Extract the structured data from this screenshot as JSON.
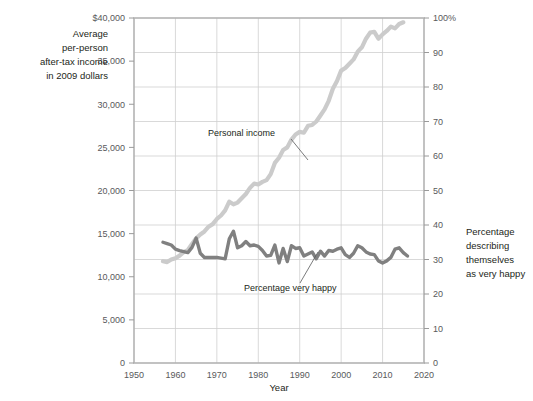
{
  "chart_data": {
    "type": "line",
    "title": "",
    "xlabel": "Year",
    "xlim": [
      1950,
      2020
    ],
    "xticks": [
      1950,
      1960,
      1970,
      1980,
      1990,
      2000,
      2010,
      2020
    ],
    "grid": true,
    "legend_position": "inline-annotations",
    "left_axis": {
      "label": "Average per-person after-tax income in 2009 dollars",
      "label_lines": [
        "Average",
        "per-person",
        "after-tax income",
        "in 2009 dollars"
      ],
      "ticks": [
        0,
        5000,
        10000,
        15000,
        20000,
        25000,
        30000,
        35000,
        40000
      ],
      "tick_labels": [
        "0",
        "5,000",
        "10,000",
        "15,000",
        "20,000",
        "25,000",
        "30,000",
        "35,000",
        "$40,000"
      ],
      "lim": [
        0,
        40000
      ]
    },
    "right_axis": {
      "label": "Percentage describing themselves as very happy",
      "label_lines": [
        "Percentage",
        "describing",
        "themselves",
        "as very happy"
      ],
      "ticks": [
        0,
        10,
        20,
        30,
        40,
        50,
        60,
        70,
        80,
        90,
        100
      ],
      "tick_labels": [
        "0",
        "10",
        "20",
        "30",
        "40",
        "50",
        "60",
        "70",
        "80",
        "90",
        "100%"
      ],
      "lim": [
        0,
        100
      ]
    },
    "series": [
      {
        "name": "Personal income",
        "axis": "left",
        "color": "#cbcbcb",
        "annotation": "Personal income",
        "x": [
          1957,
          1958,
          1959,
          1960,
          1961,
          1962,
          1963,
          1964,
          1965,
          1966,
          1967,
          1968,
          1969,
          1970,
          1971,
          1972,
          1973,
          1974,
          1975,
          1976,
          1977,
          1978,
          1979,
          1980,
          1981,
          1982,
          1983,
          1984,
          1985,
          1986,
          1987,
          1988,
          1989,
          1990,
          1991,
          1992,
          1993,
          1994,
          1995,
          1996,
          1997,
          1998,
          1999,
          2000,
          2001,
          2002,
          2003,
          2004,
          2005,
          2006,
          2007,
          2008,
          2009,
          2010,
          2011,
          2012,
          2013,
          2014,
          2015
        ],
        "y": [
          11800,
          11700,
          12000,
          12150,
          12450,
          12850,
          13100,
          13800,
          14450,
          14900,
          15250,
          15800,
          16100,
          16700,
          17100,
          17700,
          18700,
          18400,
          18600,
          19100,
          19600,
          20300,
          20800,
          20700,
          21000,
          21200,
          21900,
          23200,
          23800,
          24700,
          25000,
          25900,
          26500,
          26800,
          26700,
          27500,
          27600,
          28000,
          28700,
          29400,
          30400,
          31800,
          32700,
          33900,
          34200,
          34700,
          35200,
          36100,
          36600,
          37600,
          38300,
          38400,
          37600,
          38100,
          38500,
          39000,
          38800,
          39300,
          39500
        ]
      },
      {
        "name": "Percentage very happy",
        "axis": "right",
        "color": "#808080",
        "annotation": "Percentage very happy",
        "x": [
          1957,
          1960,
          1963,
          1965,
          1966,
          1967,
          1971,
          1972,
          1973,
          1974,
          1975,
          1976,
          1977,
          1978,
          1980,
          1982,
          1983,
          1984,
          1985,
          1986,
          1987,
          1988,
          1989,
          1990,
          1991,
          1993,
          1994,
          1996,
          1998,
          2000,
          2002,
          2004,
          2006,
          2008,
          2010,
          2012,
          2014,
          2016
        ],
        "y": [
          35,
          33,
          32,
          35,
          31,
          30,
          30,
          30,
          36,
          38,
          33,
          34,
          35,
          34,
          34,
          31,
          31,
          34,
          29,
          33,
          29,
          34,
          33,
          33,
          31,
          32,
          30,
          31,
          32,
          33,
          31,
          34,
          32,
          31,
          29,
          30,
          33,
          31
        ]
      }
    ],
    "happiness_detail": {
      "x": [
        1957,
        1958,
        1959,
        1960,
        1961,
        1962,
        1963,
        1964,
        1965,
        1966,
        1967,
        1968,
        1969,
        1970,
        1971,
        1972,
        1973,
        1974,
        1975,
        1976,
        1977,
        1978,
        1979,
        1980,
        1981,
        1982,
        1983,
        1984,
        1985,
        1986,
        1987,
        1988,
        1989,
        1990,
        1991,
        1992,
        1993,
        1994,
        1995,
        1996,
        1997,
        1998,
        1999,
        2000,
        2001,
        2002,
        2003,
        2004,
        2005,
        2006,
        2007,
        2008,
        2009,
        2010,
        2011,
        2012,
        2013,
        2014,
        2015,
        2016
      ],
      "y": [
        35.0,
        34.6,
        34.2,
        33.0,
        32.6,
        32.3,
        32.0,
        33.5,
        36.2,
        31.8,
        30.6,
        30.6,
        30.6,
        30.6,
        30.4,
        30.2,
        36.0,
        38.2,
        33.4,
        34.0,
        35.2,
        34.0,
        34.2,
        33.8,
        32.6,
        31.0,
        31.2,
        34.2,
        29.0,
        33.2,
        29.4,
        34.0,
        33.2,
        33.4,
        31.0,
        31.6,
        32.2,
        30.2,
        32.4,
        31.0,
        32.6,
        32.4,
        33.0,
        33.4,
        31.4,
        30.6,
        31.8,
        34.0,
        33.4,
        32.2,
        31.6,
        31.4,
        29.6,
        29.0,
        29.6,
        30.6,
        33.0,
        33.4,
        32.0,
        31.0
      ]
    }
  },
  "annotations": {
    "income_label": "Personal income",
    "happy_label": "Percentage very happy"
  }
}
